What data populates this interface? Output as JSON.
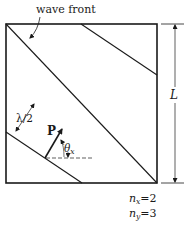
{
  "diagram": {
    "labels": {
      "wave_front": "wave front",
      "half_wavelength": "λ/2",
      "momentum": "P",
      "angle_theta": "θ",
      "angle_sub": "x",
      "side_length": "L"
    },
    "mode_numbers": {
      "nx_symbol": "n",
      "nx_sub": "x",
      "nx_value": "=2",
      "ny_symbol": "n",
      "ny_sub": "y",
      "ny_value": "=3"
    },
    "colors": {
      "stroke": "#1a1a1a",
      "background": "#ffffff"
    }
  }
}
